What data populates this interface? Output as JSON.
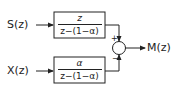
{
  "diagram": {
    "type": "block-diagram",
    "inputs": [
      {
        "id": "S",
        "label": "S(z)"
      },
      {
        "id": "X",
        "label": "X(z)"
      }
    ],
    "blocks": [
      {
        "id": "top",
        "numerator": "z",
        "denominator": "z−(1−α)"
      },
      {
        "id": "bottom",
        "numerator": "α",
        "denominator": "z−(1−α)"
      }
    ],
    "summing_junction": {
      "signs": {
        "top": "+",
        "bottom": "−"
      }
    },
    "output": {
      "label": "M(z)"
    },
    "colors": {
      "line": "#222222",
      "background": "#ffffff"
    }
  }
}
